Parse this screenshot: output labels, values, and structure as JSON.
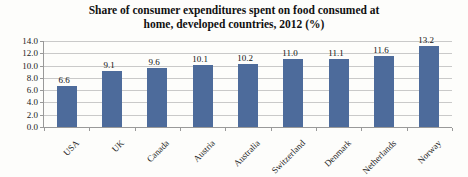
{
  "chart_data": {
    "type": "bar",
    "title": "Share of consumer expenditures spent on food consumed at home, developed countries, 2012 (%)",
    "title_lines": [
      "Share of consumer expenditures spent on food consumed at",
      "home, developed countries, 2012 (%)"
    ],
    "categories": [
      "USA",
      "UK",
      "Canada",
      "Austria",
      "Australia",
      "Switzerland",
      "Denmark",
      "Netherlands",
      "Norway"
    ],
    "values": [
      6.6,
      9.1,
      9.6,
      10.1,
      10.2,
      11.0,
      11.1,
      11.6,
      13.2
    ],
    "value_labels": [
      "6.6",
      "9.1",
      "9.6",
      "10.1",
      "10.2",
      "11.0",
      "11.1",
      "11.6",
      "13.2"
    ],
    "xlabel": "",
    "ylabel": "",
    "ylim": [
      0,
      14
    ],
    "ytick_step": 2,
    "ytick_labels": [
      "0.0",
      "2.0",
      "4.0",
      "6.0",
      "8.0",
      "10.0",
      "12.0",
      "14.0"
    ],
    "grid": "horizontal",
    "legend": "none",
    "colors": {
      "bar": "#4d6b9b",
      "gridline": "#c9c9c9",
      "axis": "#999999",
      "text": "#1f1f1f",
      "background": "#fdfdfb"
    }
  }
}
